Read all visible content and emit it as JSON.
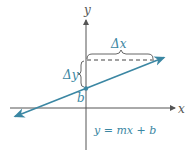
{
  "diagram": {
    "axes": {
      "x_label": "x",
      "y_label": "y"
    },
    "line": {
      "equation": "y = mx + b",
      "intercept_label": "b",
      "run_label": "Δx",
      "rise_label": "Δy"
    },
    "colors": {
      "line": "#3b87a3",
      "axis": "#555555",
      "dash": "#444444",
      "label": "#3b87a3"
    }
  }
}
